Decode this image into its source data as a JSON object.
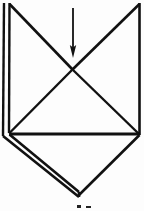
{
  "figure": {
    "background_color": "#fdfdfd",
    "ink_color": "#111111",
    "canvas": {
      "width": 144,
      "height": 211
    },
    "annotation": {
      "arrow_label": "fold-direction-arrow",
      "arrow_direction": "down",
      "arrow_x": 73,
      "arrow_top_y": 8,
      "arrow_tip_y": 58
    },
    "points": {
      "top_left_outer": "4,3",
      "top_left_inner": "9,3",
      "top_right": "140,3",
      "center_cross": "72,70",
      "left_base_outer": "3,136",
      "left_base_inner": "9,133",
      "right_base": "140,134",
      "bottom_apex": "78,196"
    },
    "strokes": [
      {
        "name": "left-outer-vertical",
        "d": "M 4 3 L 3 136",
        "width": 2.4
      },
      {
        "name": "left-inner-vertical",
        "d": "M 9.5 3 L 9 133",
        "width": 2.4
      },
      {
        "name": "left-top-diagonal",
        "d": "M 9.5 4 L 73 70",
        "width": 2.6
      },
      {
        "name": "right-top-diagonal",
        "d": "M 139.5 4 L 72 70",
        "width": 2.6
      },
      {
        "name": "right-vertical",
        "d": "M 139.5 3 L 139.5 135",
        "width": 2.6
      },
      {
        "name": "inner-triangle-left-edge",
        "d": "M 72 70 L 9 133.5",
        "width": 2.4
      },
      {
        "name": "inner-triangle-right-edge",
        "d": "M 73 70 L 139 134",
        "width": 2.4
      },
      {
        "name": "horizontal-fold-line",
        "d": "M 9 134 L 139.5 134",
        "width": 2.8
      },
      {
        "name": "bottom-left-outer-diagonal",
        "d": "M 3 136 L 79 197",
        "width": 2.6
      },
      {
        "name": "bottom-left-inner-diagonal",
        "d": "M 9.5 134.5 L 79 192",
        "width": 2.6
      },
      {
        "name": "bottom-apex-connector",
        "d": "M 79 192 L 79 197",
        "width": 2.6
      },
      {
        "name": "bottom-right-diagonal",
        "d": "M 139.5 135 L 79 195",
        "width": 2.6
      }
    ],
    "caption_marks": [
      {
        "name": "caption-fragment-left",
        "x": 77,
        "y": 205,
        "width": 4,
        "height": 3
      },
      {
        "name": "caption-fragment-right",
        "x": 86,
        "y": 206,
        "width": 5,
        "height": 2
      }
    ]
  }
}
